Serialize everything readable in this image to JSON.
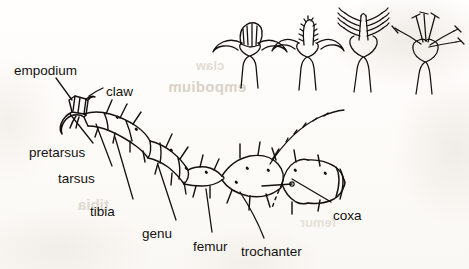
{
  "figure": {
    "kind": "scanned-line-drawing",
    "ink_color": "#14110f",
    "paper_color": "#fdfcfa",
    "width": 469,
    "height": 269
  },
  "labels": [
    {
      "id": "empodium",
      "text": "empodium",
      "x": 14,
      "y": 64
    },
    {
      "id": "claw",
      "text": "claw",
      "x": 106,
      "y": 85
    },
    {
      "id": "pretarsus",
      "text": "pretarsus",
      "x": 29,
      "y": 146
    },
    {
      "id": "tarsus",
      "text": "tarsus",
      "x": 58,
      "y": 172
    },
    {
      "id": "tibia",
      "text": "tibia",
      "x": 90,
      "y": 205
    },
    {
      "id": "genu",
      "text": "genu",
      "x": 142,
      "y": 227
    },
    {
      "id": "femur",
      "text": "femur",
      "x": 193,
      "y": 240
    },
    {
      "id": "trochanter",
      "text": "trochanter",
      "x": 241,
      "y": 245
    },
    {
      "id": "coxa",
      "text": "coxa",
      "x": 333,
      "y": 209
    }
  ],
  "bleed_through": {
    "line_1": "empodium",
    "line_2": "claw",
    "line_3": "tibia",
    "line_4": "femur"
  },
  "detail_figures": [
    {
      "id": "empodium-pad",
      "caption": ""
    },
    {
      "id": "empodium-combed",
      "caption": ""
    },
    {
      "id": "empodium-feathery",
      "caption": ""
    },
    {
      "id": "empodium-raylike",
      "caption": ""
    }
  ]
}
